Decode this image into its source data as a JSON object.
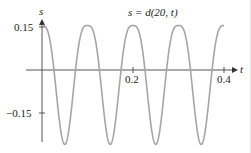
{
  "chart_data": {
    "type": "line",
    "title": "s = d(20, t)",
    "xlabel": "t",
    "ylabel": "s",
    "xlim": [
      0,
      0.4
    ],
    "ylim": [
      -0.26,
      0.16
    ],
    "x_ticks": [
      0.2,
      0.4
    ],
    "x_tick_labels": [
      "0.2",
      "0.4"
    ],
    "y_ticks": [
      0.15,
      -0.15
    ],
    "y_tick_labels": [
      "0.15",
      "−0.15"
    ],
    "grid": false,
    "legend": null,
    "series": [
      {
        "name": "s = d(20, t)",
        "description": "periodic oscillation, period about 0.1, rounded maxima near 0.155, sharp minima near -0.26",
        "x": [
          0.0,
          0.025,
          0.053,
          0.075,
          0.1,
          0.125,
          0.149,
          0.175,
          0.2,
          0.225,
          0.248,
          0.275,
          0.3,
          0.325,
          0.349,
          0.375,
          0.4
        ],
        "values": [
          0.155,
          0.02,
          -0.26,
          0.02,
          0.155,
          0.02,
          -0.26,
          0.02,
          0.155,
          0.02,
          -0.26,
          0.02,
          0.155,
          0.02,
          -0.26,
          0.02,
          0.155
        ]
      }
    ],
    "curve_color": "#a6a6a6",
    "axis_color": "#555555"
  },
  "labels": {
    "title": "s = d(20, t)",
    "x_axis": "t",
    "y_axis": "s",
    "y_tick_top": "0.15",
    "y_tick_bottom": "−0.15",
    "x_tick_mid": "0.2",
    "x_tick_end": "0.4"
  }
}
